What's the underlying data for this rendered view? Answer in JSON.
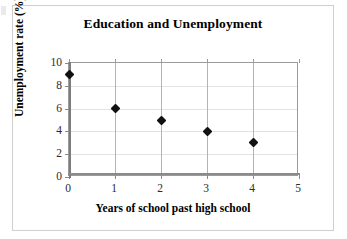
{
  "chart_data": {
    "type": "scatter",
    "title": "Education and Unemployment",
    "xlabel": "Years of school past high school",
    "ylabel": "Unemployment rate (%)",
    "x": [
      0,
      1,
      2,
      3,
      4
    ],
    "values": [
      9,
      6,
      5,
      4,
      3
    ],
    "points": [
      {
        "x": 0,
        "y": 9
      },
      {
        "x": 1,
        "y": 6
      },
      {
        "x": 2,
        "y": 5
      },
      {
        "x": 3,
        "y": 4
      },
      {
        "x": 4,
        "y": 3
      }
    ],
    "xlim": [
      0,
      5
    ],
    "ylim": [
      0,
      10
    ],
    "xticks": [
      "0",
      "1",
      "2",
      "3",
      "4",
      "5"
    ],
    "yticks": [
      "0",
      "2",
      "4",
      "6",
      "8",
      "10"
    ],
    "xtick_values": [
      0,
      1,
      2,
      3,
      4,
      5
    ],
    "ytick_values": [
      0,
      2,
      4,
      6,
      8,
      10
    ],
    "grid": "horizontal-and-vertical",
    "legend": "none",
    "marker": "diamond",
    "marker_color": "#111111",
    "gridline_color": "#e2e2e2",
    "axis_color": "#8a8a8a",
    "frame_color": "#cfcfcf",
    "background": "#ffffff"
  }
}
